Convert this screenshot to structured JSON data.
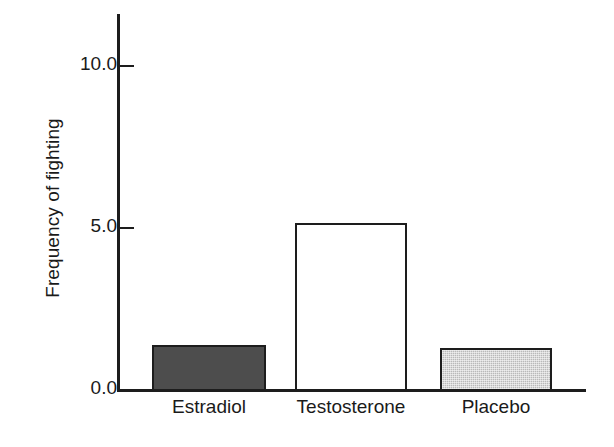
{
  "chart_data": {
    "type": "bar",
    "title": "",
    "xlabel": "",
    "ylabel": "Frequency of fighting",
    "categories": [
      "Estradiol",
      "Testosterone",
      "Placebo"
    ],
    "values": [
      1.39,
      5.15,
      1.3
    ],
    "series": [
      {
        "name": "Frequency of fighting",
        "values": [
          1.39,
          5.15,
          1.3
        ]
      }
    ],
    "ylim": [
      0.0,
      11.6
    ],
    "yticks": [
      0.0,
      5.0,
      10.0
    ],
    "ytick_labels": [
      "0.0",
      "5.0",
      "10.0"
    ],
    "grid": false,
    "legend": "none",
    "bar_styles": [
      {
        "category": "Estradiol",
        "fill": "dark-gray-solid",
        "fill_color": "#4d4d4d",
        "edge_color": "#1d1d1d"
      },
      {
        "category": "Testosterone",
        "fill": "white-unfilled",
        "fill_color": "#ffffff",
        "edge_color": "#1d1d1d"
      },
      {
        "category": "Placebo",
        "fill": "light-gray-stipple",
        "fill_color": "#b9b9b9",
        "edge_color": "#1d1d1d"
      }
    ],
    "axis_color": "#1d1d1d",
    "background_color": "#ffffff"
  }
}
